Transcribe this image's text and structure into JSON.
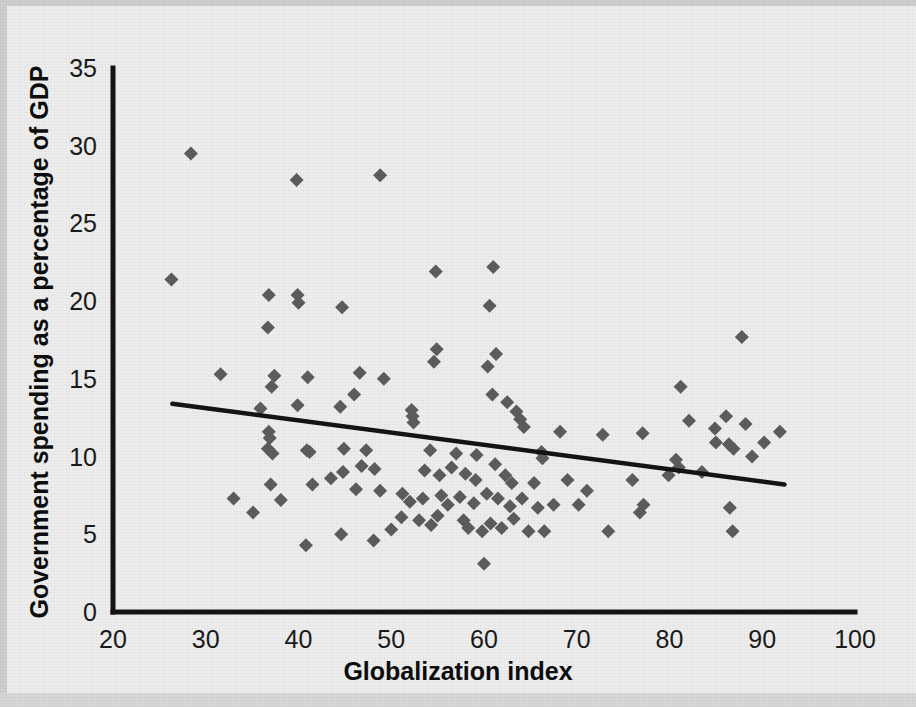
{
  "chart_data": {
    "type": "scatter",
    "title": "",
    "xlabel": "Globalization index",
    "ylabel": "Government spending as a percentage of GDP",
    "xlim": [
      20,
      100
    ],
    "ylim": [
      0,
      35
    ],
    "xticks": [
      20,
      30,
      40,
      50,
      60,
      70,
      80,
      90,
      100
    ],
    "yticks": [
      0,
      5,
      10,
      15,
      20,
      25,
      30,
      35
    ],
    "xtick_labels": [
      "20",
      "30",
      "40",
      "50",
      "60",
      "70",
      "80",
      "90",
      "100"
    ],
    "ytick_labels": [
      "0",
      "5",
      "10",
      "15",
      "20",
      "25",
      "30",
      "35"
    ],
    "grid": false,
    "legend": null,
    "marker": "diamond",
    "marker_color": "#5d5d5d",
    "axis_color": "#141414",
    "background_color": "#eeeeee",
    "trendline": {
      "type": "linear",
      "color": "#141414",
      "x_start": 26.4,
      "y_start": 13.4,
      "x_end": 92.4,
      "y_end": 8.2
    },
    "points": [
      [
        28.4,
        29.5
      ],
      [
        48.8,
        28.1
      ],
      [
        39.8,
        27.8
      ],
      [
        26.3,
        21.4
      ],
      [
        61.0,
        22.2
      ],
      [
        54.8,
        21.9
      ],
      [
        36.8,
        20.4
      ],
      [
        39.9,
        20.4
      ],
      [
        44.7,
        19.6
      ],
      [
        60.6,
        19.7
      ],
      [
        40.0,
        19.9
      ],
      [
        36.7,
        18.3
      ],
      [
        87.8,
        17.7
      ],
      [
        54.9,
        16.9
      ],
      [
        61.3,
        16.6
      ],
      [
        54.6,
        16.1
      ],
      [
        60.4,
        15.8
      ],
      [
        46.6,
        15.4
      ],
      [
        37.4,
        15.2
      ],
      [
        41.0,
        15.1
      ],
      [
        31.6,
        15.3
      ],
      [
        49.2,
        15.0
      ],
      [
        37.1,
        14.5
      ],
      [
        81.2,
        14.5
      ],
      [
        46.0,
        14.0
      ],
      [
        60.9,
        14.0
      ],
      [
        62.5,
        13.5
      ],
      [
        52.2,
        13.0
      ],
      [
        52.3,
        12.6
      ],
      [
        52.4,
        12.2
      ],
      [
        35.9,
        13.1
      ],
      [
        44.5,
        13.2
      ],
      [
        39.9,
        13.3
      ],
      [
        63.5,
        12.9
      ],
      [
        63.9,
        12.4
      ],
      [
        64.3,
        11.9
      ],
      [
        86.1,
        12.6
      ],
      [
        82.1,
        12.3
      ],
      [
        88.2,
        12.1
      ],
      [
        84.9,
        11.8
      ],
      [
        91.9,
        11.6
      ],
      [
        68.2,
        11.6
      ],
      [
        72.8,
        11.4
      ],
      [
        77.1,
        11.5
      ],
      [
        36.8,
        11.6
      ],
      [
        36.9,
        11.2
      ],
      [
        40.9,
        10.4
      ],
      [
        36.7,
        10.5
      ],
      [
        37.2,
        10.2
      ],
      [
        41.2,
        10.3
      ],
      [
        44.9,
        10.5
      ],
      [
        47.3,
        10.4
      ],
      [
        54.2,
        10.4
      ],
      [
        57.0,
        10.2
      ],
      [
        59.2,
        10.1
      ],
      [
        66.2,
        10.3
      ],
      [
        66.3,
        9.9
      ],
      [
        80.7,
        9.8
      ],
      [
        81.0,
        9.3
      ],
      [
        85.0,
        10.9
      ],
      [
        88.9,
        10.0
      ],
      [
        90.2,
        10.9
      ],
      [
        86.4,
        10.8
      ],
      [
        86.9,
        10.5
      ],
      [
        46.8,
        9.4
      ],
      [
        48.2,
        9.2
      ],
      [
        44.8,
        9.0
      ],
      [
        43.5,
        8.6
      ],
      [
        53.6,
        9.1
      ],
      [
        55.2,
        8.8
      ],
      [
        56.5,
        9.3
      ],
      [
        58.0,
        8.9
      ],
      [
        59.1,
        8.5
      ],
      [
        61.2,
        9.5
      ],
      [
        62.3,
        8.8
      ],
      [
        63.0,
        8.3
      ],
      [
        65.4,
        8.3
      ],
      [
        69.0,
        8.5
      ],
      [
        71.1,
        7.8
      ],
      [
        76.0,
        8.5
      ],
      [
        79.9,
        8.8
      ],
      [
        83.5,
        9.0
      ],
      [
        37.0,
        8.2
      ],
      [
        38.1,
        7.2
      ],
      [
        41.5,
        8.2
      ],
      [
        46.2,
        7.9
      ],
      [
        48.8,
        7.8
      ],
      [
        51.2,
        7.6
      ],
      [
        52.0,
        7.1
      ],
      [
        53.4,
        7.3
      ],
      [
        55.4,
        7.5
      ],
      [
        56.1,
        6.9
      ],
      [
        57.4,
        7.4
      ],
      [
        58.9,
        7.0
      ],
      [
        60.3,
        7.6
      ],
      [
        61.5,
        7.3
      ],
      [
        62.8,
        6.8
      ],
      [
        64.1,
        7.3
      ],
      [
        65.8,
        6.7
      ],
      [
        67.5,
        6.9
      ],
      [
        70.2,
        6.9
      ],
      [
        73.4,
        5.2
      ],
      [
        76.8,
        6.4
      ],
      [
        77.2,
        6.9
      ],
      [
        86.5,
        6.7
      ],
      [
        33.0,
        7.3
      ],
      [
        35.1,
        6.4
      ],
      [
        51.1,
        6.1
      ],
      [
        53.0,
        5.9
      ],
      [
        54.3,
        5.6
      ],
      [
        55.0,
        6.2
      ],
      [
        57.8,
        5.9
      ],
      [
        58.3,
        5.4
      ],
      [
        59.8,
        5.2
      ],
      [
        60.7,
        5.7
      ],
      [
        61.9,
        5.4
      ],
      [
        63.2,
        6.0
      ],
      [
        64.8,
        5.2
      ],
      [
        66.5,
        5.2
      ],
      [
        50.0,
        5.3
      ],
      [
        44.6,
        5.0
      ],
      [
        48.1,
        4.6
      ],
      [
        40.8,
        4.3
      ],
      [
        86.8,
        5.2
      ],
      [
        60.0,
        3.1
      ]
    ]
  },
  "axes": {
    "x_title": "Globalization index",
    "y_title": "Government spending as a percentage of GDP"
  }
}
